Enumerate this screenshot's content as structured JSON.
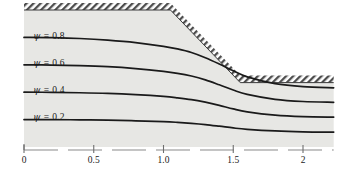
{
  "figure": {
    "title": "",
    "background_color": "#ffffff",
    "domain_fill_color": "#e7e7e4",
    "line_color": "#1a1a1a",
    "hatch_color": "#4d4d4d"
  },
  "axis": {
    "name": "x-axis",
    "tick_values": [
      0,
      0.5,
      1.0,
      1.5,
      2
    ],
    "tick_labels": [
      "0",
      "0.5",
      "1.0",
      "1.5",
      "2"
    ],
    "range": [
      0,
      2.22
    ],
    "style": "dashed-with-ticks",
    "grid": false
  },
  "stream_labels": [
    {
      "symbol": "ψ",
      "equals": "=",
      "value": "0.8",
      "text": "ψ = 0.8"
    },
    {
      "symbol": "ψ",
      "equals": "=",
      "value": "0.6",
      "text": "ψ = 0.6"
    },
    {
      "symbol": "ψ",
      "equals": "=",
      "value": "0.4",
      "text": "ψ = 0.4"
    },
    {
      "symbol": "ψ",
      "equals": "=",
      "value": "0.2",
      "text": "ψ = 0.2"
    }
  ],
  "chart_data": {
    "type": "line",
    "title": "",
    "xlabel": "",
    "ylabel": "",
    "xlim": [
      0,
      2.22
    ],
    "ylim": [
      0,
      1.0
    ],
    "grid": false,
    "legend": "inline-labels",
    "annotations": [
      "ψ = 0.8",
      "ψ = 0.6",
      "ψ = 0.4",
      "ψ = 0.2"
    ],
    "boundary": {
      "name": "hatched-upper-wall",
      "hatched": true,
      "x": [
        0.0,
        1.05,
        1.55,
        2.22
      ],
      "y": [
        1.0,
        1.0,
        0.47,
        0.47
      ]
    },
    "series": [
      {
        "name": "ψ = 0.8",
        "value": 0.8,
        "x": [
          0.0,
          0.2,
          0.4,
          0.6,
          0.8,
          1.0,
          1.1,
          1.2,
          1.3,
          1.4,
          1.5,
          1.6,
          1.8,
          2.0,
          2.22
        ],
        "y": [
          0.8,
          0.798,
          0.792,
          0.78,
          0.762,
          0.735,
          0.716,
          0.69,
          0.652,
          0.606,
          0.556,
          0.512,
          0.462,
          0.44,
          0.432
        ]
      },
      {
        "name": "ψ = 0.6",
        "value": 0.6,
        "x": [
          0.0,
          0.2,
          0.4,
          0.6,
          0.8,
          1.0,
          1.1,
          1.2,
          1.3,
          1.4,
          1.5,
          1.6,
          1.8,
          2.0,
          2.22
        ],
        "y": [
          0.6,
          0.598,
          0.594,
          0.586,
          0.572,
          0.552,
          0.538,
          0.518,
          0.49,
          0.454,
          0.416,
          0.384,
          0.348,
          0.332,
          0.326
        ]
      },
      {
        "name": "ψ = 0.4",
        "value": 0.4,
        "x": [
          0.0,
          0.2,
          0.4,
          0.6,
          0.8,
          1.0,
          1.1,
          1.2,
          1.3,
          1.4,
          1.5,
          1.6,
          1.8,
          2.0,
          2.22
        ],
        "y": [
          0.4,
          0.399,
          0.396,
          0.391,
          0.382,
          0.369,
          0.359,
          0.346,
          0.327,
          0.304,
          0.278,
          0.257,
          0.233,
          0.222,
          0.218
        ]
      },
      {
        "name": "ψ = 0.2",
        "value": 0.2,
        "x": [
          0.0,
          0.2,
          0.4,
          0.6,
          0.8,
          1.0,
          1.1,
          1.2,
          1.3,
          1.4,
          1.5,
          1.6,
          1.8,
          2.0,
          2.22
        ],
        "y": [
          0.2,
          0.2,
          0.198,
          0.196,
          0.191,
          0.185,
          0.18,
          0.173,
          0.164,
          0.152,
          0.139,
          0.129,
          0.117,
          0.111,
          0.109
        ]
      }
    ]
  }
}
